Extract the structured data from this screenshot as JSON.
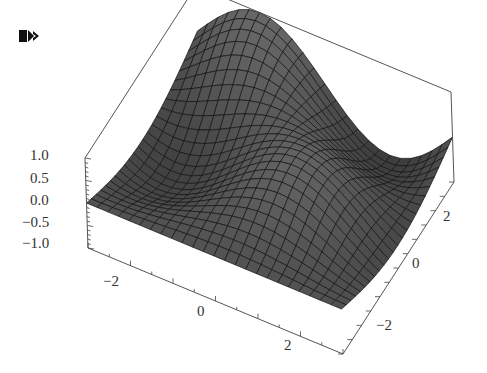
{
  "cell": {
    "marker_icon": "output-cell-arrow-icon"
  },
  "chart_data": {
    "type": "surface3d",
    "title": "",
    "function_hint": "smooth periodic surface, range [-1, 1]",
    "x_range": [
      -3.14,
      3.14
    ],
    "y_range": [
      -3.14,
      3.14
    ],
    "z_range": [
      -1.0,
      1.0
    ],
    "z_ticks": [
      "1.0",
      "0.5",
      "0.0",
      "-0.5",
      "-1.0"
    ],
    "x_ticks": [
      "-2",
      "0",
      "2"
    ],
    "y_ticks": [
      "-2",
      "0",
      "2"
    ],
    "xlabel": "",
    "ylabel": "",
    "zlabel": "",
    "box": true,
    "mesh": true,
    "surface_color": "#4a4a4a",
    "mesh_color": "#111111",
    "box_color": "#555555"
  },
  "axes": {
    "z": {
      "labels": [
        "1.0",
        "0.5",
        "0.0",
        "−0.5",
        "−1.0"
      ]
    },
    "x": {
      "labels": [
        "−2",
        "0",
        "2"
      ]
    },
    "y": {
      "labels": [
        "2",
        "0",
        "−2"
      ]
    }
  }
}
